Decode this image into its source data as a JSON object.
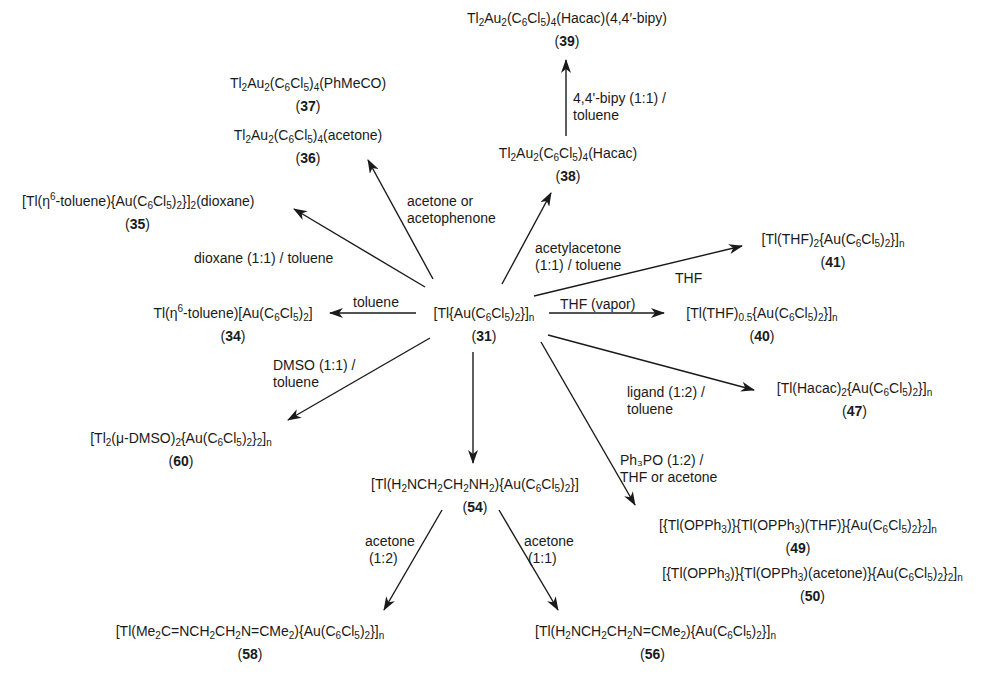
{
  "diagram": {
    "type": "reaction-scheme",
    "center": {
      "id": "31",
      "formula_html": "[Tl{Au(C<sub>6</sub>Cl<sub>5</sub>)<sub>2</sub>}]<sub>n</sub>",
      "number": "31"
    },
    "nodes": [
      {
        "id": "39",
        "formula_html": "Tl<sub>2</sub>Au<sub>2</sub>(C<sub>6</sub>Cl<sub>5</sub>)<sub>4</sub>(Hacac)(4,4′-bipy)",
        "number": "39"
      },
      {
        "id": "37",
        "formula_html": "Tl<sub>2</sub>Au<sub>2</sub>(C<sub>6</sub>Cl<sub>5</sub>)<sub>4</sub>(PhMeCO)",
        "number": "37"
      },
      {
        "id": "36",
        "formula_html": "Tl<sub>2</sub>Au<sub>2</sub>(C<sub>6</sub>Cl<sub>5</sub>)<sub>4</sub>(acetone)",
        "number": "36"
      },
      {
        "id": "38",
        "formula_html": "Tl<sub>2</sub>Au<sub>2</sub>(C<sub>6</sub>Cl<sub>5</sub>)<sub>4</sub>(Hacac)",
        "number": "38"
      },
      {
        "id": "35",
        "formula_html": "[Tl(η<sup>6</sup>-toluene){Au(C<sub>6</sub>Cl<sub>5</sub>)<sub>2</sub>}]<sub>2</sub>(dioxane)",
        "number": "35"
      },
      {
        "id": "41",
        "formula_html": "[Tl(THF)<sub>2</sub>{Au(C<sub>6</sub>Cl<sub>5</sub>)<sub>2</sub>}]<sub>n</sub>",
        "number": "41"
      },
      {
        "id": "34",
        "formula_html": "Tl(η<sup>6</sup>-toluene)[Au(C<sub>6</sub>Cl<sub>5</sub>)<sub>2</sub>]",
        "number": "34"
      },
      {
        "id": "40",
        "formula_html": "[Tl(THF)<sub>0.5</sub>{Au(C<sub>6</sub>Cl<sub>5</sub>)<sub>2</sub>}]<sub>n</sub>",
        "number": "40"
      },
      {
        "id": "47",
        "formula_html": "[Tl(Hacac)<sub>2</sub>{Au(C<sub>6</sub>Cl<sub>5</sub>)<sub>2</sub>}]<sub>n</sub>",
        "number": "47"
      },
      {
        "id": "60",
        "formula_html": "[Tl<sub>2</sub>(μ-DMSO)<sub>2</sub>{Au(C<sub>6</sub>Cl<sub>5</sub>)<sub>2</sub>}<sub>2</sub>]<sub>n</sub>",
        "number": "60"
      },
      {
        "id": "54",
        "formula_html": "[Tl(H<sub>2</sub>NCH<sub>2</sub>CH<sub>2</sub>NH<sub>2</sub>){Au(C<sub>6</sub>Cl<sub>5</sub>)<sub>2</sub>}]",
        "number": "54"
      },
      {
        "id": "49",
        "formula_html": "[{Tl(OPPh<sub>3</sub>)}{Tl(OPPh<sub>3</sub>)(THF)}{Au(C<sub>6</sub>Cl<sub>5</sub>)<sub>2</sub>}<sub>2</sub>]<sub>n</sub>",
        "number": "49"
      },
      {
        "id": "50",
        "formula_html": "[{Tl(OPPh<sub>3</sub>)}{Tl(OPPh<sub>3</sub>)(acetone)}{Au(C<sub>6</sub>Cl<sub>5</sub>)<sub>2</sub>}<sub>2</sub>]<sub>n</sub>",
        "number": "50"
      },
      {
        "id": "58",
        "formula_html": "[Tl(Me<sub>2</sub>C=NCH<sub>2</sub>CH<sub>2</sub>N=CMe<sub>2</sub>){Au(C<sub>6</sub>Cl<sub>5</sub>)<sub>2</sub>}]<sub>n</sub>",
        "number": "58"
      },
      {
        "id": "56",
        "formula_html": "[Tl(H<sub>2</sub>NCH<sub>2</sub>CH<sub>2</sub>N=CMe<sub>2</sub>){Au(C<sub>6</sub>Cl<sub>5</sub>)<sub>2</sub>}]<sub>n</sub>",
        "number": "56"
      }
    ],
    "conditions": {
      "bipy": "4,4'-bipy (1:1) /\ntoluene",
      "acetone_or_acetophenone": "acetone or\nacetophenone",
      "acetylacetone": "acetylacetone\n(1:1) / toluene",
      "dioxane": "dioxane (1:1) / toluene",
      "thf": "THF",
      "toluene": "toluene",
      "thf_vapor": "THF (vapor)",
      "ligand": "ligand (1:2) /\ntoluene",
      "dmso": "DMSO (1:1) /\ntoluene",
      "ph3po": "Ph₃PO (1:2) /\nTHF or acetone",
      "acetone_12": "acetone\n (1:2)",
      "acetone_11": "acetone\n (1:1)"
    },
    "edges": [
      {
        "from": "31",
        "to": "36/37",
        "condition": "acetone or acetophenone"
      },
      {
        "from": "31",
        "to": "38",
        "condition": "acetylacetone (1:1) / toluene"
      },
      {
        "from": "38",
        "to": "39",
        "condition": "4,4'-bipy (1:1) / toluene"
      },
      {
        "from": "31",
        "to": "35",
        "condition": "dioxane (1:1) / toluene"
      },
      {
        "from": "31",
        "to": "34",
        "condition": "toluene"
      },
      {
        "from": "31",
        "to": "41",
        "condition": "THF"
      },
      {
        "from": "31",
        "to": "40",
        "condition": "THF (vapor)"
      },
      {
        "from": "31",
        "to": "47",
        "condition": "ligand (1:2) / toluene"
      },
      {
        "from": "31",
        "to": "60",
        "condition": "DMSO (1:1) / toluene"
      },
      {
        "from": "31",
        "to": "54",
        "condition": ""
      },
      {
        "from": "31",
        "to": "49/50",
        "condition": "Ph3PO (1:2) / THF or acetone"
      },
      {
        "from": "54",
        "to": "58",
        "condition": "acetone (1:2)"
      },
      {
        "from": "54",
        "to": "56",
        "condition": "acetone (1:1)"
      }
    ],
    "colors": {
      "ink": "#1a1a1a",
      "background": "#ffffff"
    }
  }
}
